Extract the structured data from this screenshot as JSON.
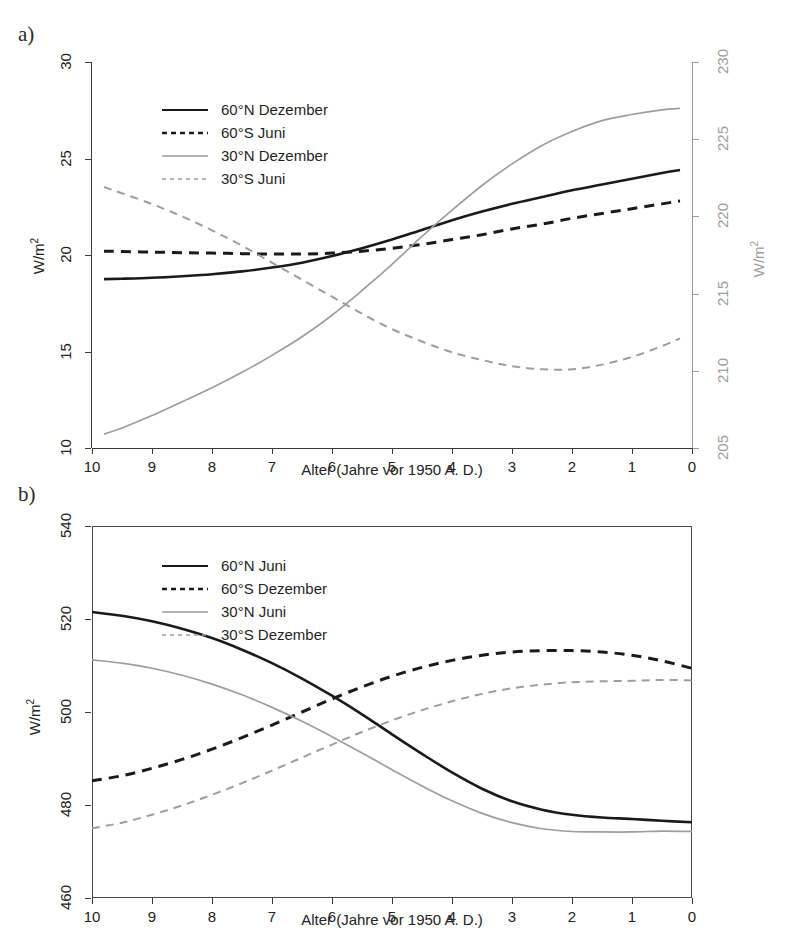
{
  "figure": {
    "panels": [
      {
        "id": "a",
        "label": "a)",
        "xlabel": "Alter (Jahre vor 1950 A. D.)",
        "ylabel_left": "W/m",
        "ylabel_left_sup": "2",
        "ylabel_right": "W/m",
        "ylabel_right_sup": "2",
        "xticks": [
          "10",
          "9",
          "8",
          "7",
          "6",
          "5",
          "4",
          "3",
          "2",
          "1",
          "0"
        ],
        "yticks_left": [
          "30",
          "25",
          "20",
          "15",
          "10"
        ],
        "yticks_right": [
          "230",
          "225",
          "220",
          "215",
          "210",
          "205"
        ],
        "legend": [
          {
            "label": "60°N Dezember",
            "color": "#1a1a1a",
            "style": "solid",
            "width": 2.6
          },
          {
            "label": "60°S Juni",
            "color": "#1a1a1a",
            "style": "dashed",
            "width": 2.6
          },
          {
            "label": "30°N Dezember",
            "color": "#9d9d9d",
            "style": "solid",
            "width": 1.8
          },
          {
            "label": "30°S Juni",
            "color": "#9d9d9d",
            "style": "dashed",
            "width": 1.8
          }
        ]
      },
      {
        "id": "b",
        "label": "b)",
        "xlabel": "Alter (Jahre vor 1950 A. D.)",
        "ylabel_left": "W/m",
        "ylabel_left_sup": "2",
        "xticks": [
          "10",
          "9",
          "8",
          "7",
          "6",
          "5",
          "4",
          "3",
          "2",
          "1",
          "0"
        ],
        "yticks_left": [
          "540",
          "520",
          "500",
          "480",
          "460"
        ],
        "legend": [
          {
            "label": "60°N Juni",
            "color": "#1a1a1a",
            "style": "solid",
            "width": 2.6
          },
          {
            "label": "60°S Dezember",
            "color": "#1a1a1a",
            "style": "dashed",
            "width": 2.6
          },
          {
            "label": "30°N Juni",
            "color": "#9d9d9d",
            "style": "solid",
            "width": 1.8
          },
          {
            "label": "30°S Dezember",
            "color": "#9d9d9d",
            "style": "dashed",
            "width": 1.8
          }
        ]
      }
    ]
  },
  "chart_data": [
    {
      "type": "line",
      "panel": "a",
      "title": "",
      "xlabel": "Alter (Jahre vor 1950 A. D.)",
      "ylabel": "W/m2",
      "ylabel_secondary": "W/m2",
      "xlim": [
        10,
        0
      ],
      "xticks": [
        10,
        9,
        8,
        7,
        6,
        5,
        4,
        3,
        2,
        1,
        0
      ],
      "ylim": [
        10,
        30
      ],
      "yticks": [
        10,
        15,
        20,
        25,
        30
      ],
      "ylim_secondary": [
        205,
        230
      ],
      "yticks_secondary": [
        205,
        210,
        215,
        220,
        225,
        230
      ],
      "grid": false,
      "legend_position": "upper left",
      "x": [
        9.8,
        9.5,
        9.0,
        8.5,
        8.0,
        7.5,
        7.0,
        6.5,
        6.0,
        5.5,
        5.0,
        4.5,
        4.0,
        3.5,
        3.0,
        2.5,
        2.0,
        1.5,
        1.0,
        0.5,
        0.2
      ],
      "series": [
        {
          "name": "60°N Dezember",
          "axis": "left",
          "color": "#1a1a1a",
          "style": "solid",
          "values": [
            18.75,
            18.77,
            18.82,
            18.9,
            19.0,
            19.15,
            19.35,
            19.6,
            19.95,
            20.35,
            20.8,
            21.3,
            21.8,
            22.25,
            22.65,
            23.0,
            23.35,
            23.65,
            23.95,
            24.25,
            24.4
          ]
        },
        {
          "name": "60°S Juni",
          "axis": "left",
          "color": "#1a1a1a",
          "style": "dashed",
          "values": [
            20.2,
            20.18,
            20.15,
            20.12,
            20.1,
            20.07,
            20.05,
            20.05,
            20.1,
            20.2,
            20.35,
            20.55,
            20.8,
            21.05,
            21.35,
            21.6,
            21.9,
            22.15,
            22.4,
            22.65,
            22.8
          ]
        },
        {
          "name": "30°N Dezember",
          "axis": "right",
          "color": "#9d9d9d",
          "style": "solid",
          "values": [
            205.9,
            206.3,
            207.1,
            208.0,
            208.9,
            209.9,
            211.0,
            212.2,
            213.6,
            215.2,
            216.9,
            218.7,
            220.4,
            222.0,
            223.4,
            224.6,
            225.5,
            226.2,
            226.6,
            226.9,
            227.0
          ]
        },
        {
          "name": "30°S Juni",
          "axis": "right",
          "color": "#9d9d9d",
          "style": "dashed",
          "values": [
            221.9,
            221.5,
            220.8,
            220.0,
            219.1,
            218.1,
            217.0,
            215.9,
            214.8,
            213.7,
            212.7,
            211.9,
            211.2,
            210.7,
            210.3,
            210.1,
            210.1,
            210.4,
            210.9,
            211.6,
            212.1
          ]
        }
      ]
    },
    {
      "type": "line",
      "panel": "b",
      "title": "",
      "xlabel": "Alter (Jahre vor 1950 A. D.)",
      "ylabel": "W/m2",
      "xlim": [
        10,
        0
      ],
      "xticks": [
        10,
        9,
        8,
        7,
        6,
        5,
        4,
        3,
        2,
        1,
        0
      ],
      "ylim": [
        460,
        540
      ],
      "yticks": [
        460,
        480,
        500,
        520,
        540
      ],
      "grid": false,
      "legend_position": "upper left",
      "x": [
        10.0,
        9.5,
        9.0,
        8.5,
        8.0,
        7.5,
        7.0,
        6.5,
        6.0,
        5.5,
        5.0,
        4.5,
        4.0,
        3.5,
        3.0,
        2.5,
        2.0,
        1.5,
        1.0,
        0.5,
        0.0
      ],
      "series": [
        {
          "name": "60°N Juni",
          "axis": "left",
          "color": "#1a1a1a",
          "style": "solid",
          "values": [
            521.5,
            520.7,
            519.5,
            517.9,
            515.9,
            513.4,
            510.5,
            507.2,
            503.5,
            499.5,
            495.2,
            491.0,
            487.0,
            483.5,
            480.8,
            479.0,
            477.9,
            477.3,
            477.0,
            476.6,
            476.3
          ]
        },
        {
          "name": "60°S Dezember",
          "axis": "left",
          "color": "#1a1a1a",
          "style": "dashed",
          "values": [
            485.2,
            486.3,
            487.9,
            489.8,
            492.0,
            494.5,
            497.2,
            500.0,
            502.8,
            505.4,
            507.7,
            509.6,
            511.1,
            512.2,
            512.9,
            513.2,
            513.2,
            512.9,
            512.2,
            511.0,
            509.4
          ]
        },
        {
          "name": "30°N Juni",
          "axis": "left",
          "color": "#9d9d9d",
          "style": "solid",
          "values": [
            511.2,
            510.5,
            509.4,
            507.9,
            506.0,
            503.7,
            501.0,
            498.0,
            494.7,
            491.2,
            487.6,
            484.1,
            480.9,
            478.2,
            476.2,
            474.9,
            474.3,
            474.2,
            474.2,
            474.4,
            474.3
          ]
        },
        {
          "name": "30°S Dezember",
          "axis": "left",
          "color": "#9d9d9d",
          "style": "dashed",
          "values": [
            475.0,
            476.2,
            477.9,
            479.9,
            482.2,
            484.7,
            487.4,
            490.2,
            493.0,
            495.7,
            498.2,
            500.4,
            502.3,
            503.9,
            505.1,
            505.9,
            506.4,
            506.6,
            506.7,
            506.9,
            506.8
          ]
        }
      ]
    }
  ]
}
